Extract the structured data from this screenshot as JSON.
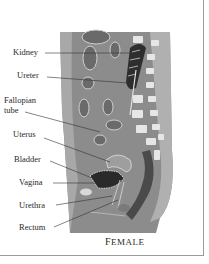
{
  "figure": {
    "caption": "Female",
    "labels": [
      {
        "id": "kidney",
        "text": "Kidney"
      },
      {
        "id": "ureter",
        "text": "Ureter"
      },
      {
        "id": "fallopian-tube-line1",
        "text": "Fallopian"
      },
      {
        "id": "fallopian-tube-line2",
        "text": "tube"
      },
      {
        "id": "uterus",
        "text": "Uterus"
      },
      {
        "id": "bladder",
        "text": "Bladder"
      },
      {
        "id": "vagina",
        "text": "Vagina"
      },
      {
        "id": "urethra",
        "text": "Urethra"
      },
      {
        "id": "rectum",
        "text": "Rectum"
      }
    ]
  },
  "colors": {
    "body": "#8c8c8c",
    "skin": "#b5b5b5",
    "organ_dark": "#5a5a5a",
    "bone": "#e6e6e6",
    "border": "#9a9a9a"
  }
}
